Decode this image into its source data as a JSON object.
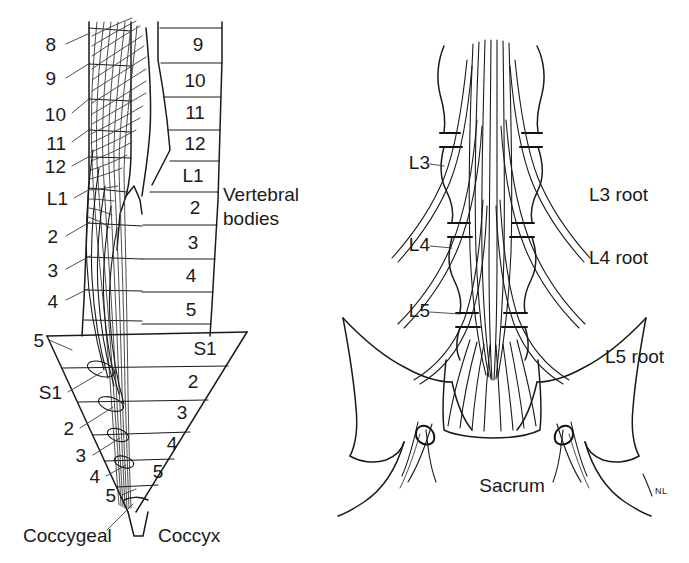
{
  "figure": {
    "background_color": "#ffffff",
    "ink_color": "#1a1a1a",
    "signature": "NL"
  },
  "left_panel": {
    "name": "cord-segment-vs-vertebra-diagram",
    "caption_right": {
      "line1": "Vertebral",
      "line2": "bodies"
    },
    "cord_segment_labels": [
      {
        "text": "8",
        "x": 56,
        "y": 46
      },
      {
        "text": "9",
        "x": 56,
        "y": 80
      },
      {
        "text": "10",
        "x": 60,
        "y": 116
      },
      {
        "text": "11",
        "x": 60,
        "y": 145
      },
      {
        "text": "12",
        "x": 60,
        "y": 168
      },
      {
        "text": "L1",
        "x": 62,
        "y": 200
      },
      {
        "text": "2",
        "x": 56,
        "y": 238
      },
      {
        "text": "3",
        "x": 56,
        "y": 272
      },
      {
        "text": "4",
        "x": 56,
        "y": 303
      },
      {
        "text": "5",
        "x": 39,
        "y": 342
      },
      {
        "text": "S1",
        "x": 56,
        "y": 394
      },
      {
        "text": "2",
        "x": 70,
        "y": 430
      },
      {
        "text": "3",
        "x": 82,
        "y": 457
      },
      {
        "text": "4",
        "x": 96,
        "y": 478
      },
      {
        "text": "5",
        "x": 112,
        "y": 497
      }
    ],
    "vertebral_body_labels": [
      {
        "text": "9",
        "x": 198,
        "y": 46
      },
      {
        "text": "10",
        "x": 198,
        "y": 82
      },
      {
        "text": "11",
        "x": 196,
        "y": 114
      },
      {
        "text": "12",
        "x": 196,
        "y": 145
      },
      {
        "text": "L1",
        "x": 196,
        "y": 177
      },
      {
        "text": "2",
        "x": 196,
        "y": 209
      },
      {
        "text": "3",
        "x": 196,
        "y": 244
      },
      {
        "text": "4",
        "x": 196,
        "y": 277
      },
      {
        "text": "5",
        "x": 198,
        "y": 311
      },
      {
        "text": "S1",
        "x": 205,
        "y": 348
      },
      {
        "text": "2",
        "x": 196,
        "y": 383
      },
      {
        "text": "3",
        "x": 186,
        "y": 414
      },
      {
        "text": "4",
        "x": 178,
        "y": 445
      },
      {
        "text": "5",
        "x": 165,
        "y": 473
      }
    ],
    "bottom_labels": [
      {
        "text": "Coccygeal",
        "x": 23,
        "y": 537
      },
      {
        "text": "Coccyx",
        "x": 158,
        "y": 537
      }
    ]
  },
  "right_panel": {
    "name": "lumbosacral-nerve-root-diagram",
    "vertebra_labels": [
      {
        "text": "L3",
        "x": 412,
        "y": 164
      },
      {
        "text": "L4",
        "x": 412,
        "y": 246
      },
      {
        "text": "L5",
        "x": 412,
        "y": 312
      }
    ],
    "root_labels": [
      {
        "text": "L3 root",
        "x": 589,
        "y": 196
      },
      {
        "text": "L4 root",
        "x": 589,
        "y": 259
      },
      {
        "text": "L5 root",
        "x": 605,
        "y": 358
      }
    ],
    "bone_labels": [
      {
        "text": "Sacrum",
        "x": 512,
        "y": 487
      }
    ]
  }
}
